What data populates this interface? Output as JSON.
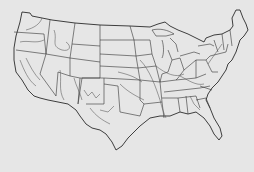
{
  "map": {
    "title": "",
    "subject": "Contiguous United States outline with state boundaries and major rivers",
    "background_color": "#e6e6e6",
    "line_color": "#2a2a2a",
    "river_color": "#555555"
  }
}
